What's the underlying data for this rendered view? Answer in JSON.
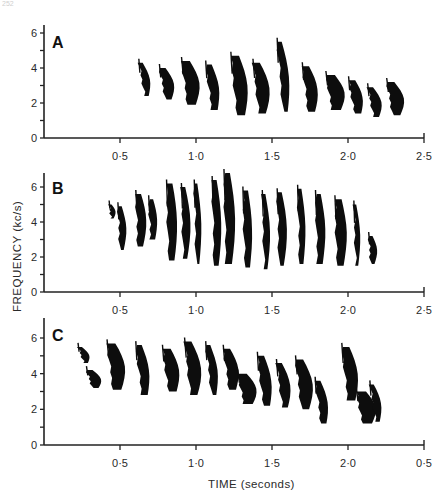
{
  "page_number": "252",
  "chart_data": [
    {
      "type": "spectrogram",
      "panel": "A",
      "title": "A",
      "xlabel": "TIME (seconds)",
      "ylabel": "FREQUENCY (kc/s)",
      "xlim": [
        0,
        2.5
      ],
      "ylim": [
        0,
        6.5
      ],
      "x_tick_labels": [
        "0·5",
        "1·0",
        "1·5",
        "2·0",
        "2·5"
      ],
      "y_tick_labels": [
        "0",
        "2",
        "4",
        "6"
      ],
      "y_minor_ticks": [
        1,
        3,
        5
      ],
      "grid": false,
      "description": "About 14 descending notes, approx 0.62–2.33 s, frequency band roughly 1.2–5.5 kc/s, drifting downward over time",
      "syllables": [
        {
          "t": 0.64,
          "f_top": 4.3,
          "f_bottom": 2.4
        },
        {
          "t": 0.78,
          "f_top": 4.0,
          "f_bottom": 2.2
        },
        {
          "t": 0.93,
          "f_top": 4.4,
          "f_bottom": 1.9
        },
        {
          "t": 1.08,
          "f_top": 4.2,
          "f_bottom": 1.6
        },
        {
          "t": 1.25,
          "f_top": 4.7,
          "f_bottom": 1.3
        },
        {
          "t": 1.4,
          "f_top": 4.3,
          "f_bottom": 1.4
        },
        {
          "t": 1.55,
          "f_top": 5.5,
          "f_bottom": 1.5
        },
        {
          "t": 1.72,
          "f_top": 4.1,
          "f_bottom": 1.5
        },
        {
          "t": 1.88,
          "f_top": 3.6,
          "f_bottom": 1.6
        },
        {
          "t": 2.02,
          "f_top": 3.3,
          "f_bottom": 1.4
        },
        {
          "t": 2.15,
          "f_top": 2.9,
          "f_bottom": 1.2
        },
        {
          "t": 2.28,
          "f_top": 3.2,
          "f_bottom": 1.3
        }
      ]
    },
    {
      "type": "spectrogram",
      "panel": "B",
      "title": "B",
      "xlabel": "TIME (seconds)",
      "ylabel": "FREQUENCY (kc/s)",
      "xlim": [
        0,
        2.5
      ],
      "ylim": [
        0,
        6.5
      ],
      "x_tick_labels": [
        "0·5",
        "1·0",
        "1·5",
        "2·0",
        "2·5"
      ],
      "y_tick_labels": [
        "0",
        "2",
        "4",
        "6"
      ],
      "y_minor_ticks": [
        1,
        3,
        5
      ],
      "grid": false,
      "description": "Faint thin strokes 0.42–0.75 s near 4–5 kc/s, then dense vertical notes 0.8–2.18 s spanning roughly 1.3–6.8 kc/s",
      "syllables": [
        {
          "t": 0.44,
          "f_top": 5.0,
          "f_bottom": 4.2
        },
        {
          "t": 0.5,
          "f_top": 4.9,
          "f_bottom": 2.4
        },
        {
          "t": 0.62,
          "f_top": 5.6,
          "f_bottom": 2.6
        },
        {
          "t": 0.7,
          "f_top": 5.3,
          "f_bottom": 3.0
        },
        {
          "t": 0.82,
          "f_top": 6.2,
          "f_bottom": 1.8
        },
        {
          "t": 0.92,
          "f_top": 6.0,
          "f_bottom": 1.9
        },
        {
          "t": 1.0,
          "f_top": 6.2,
          "f_bottom": 1.6
        },
        {
          "t": 1.12,
          "f_top": 6.4,
          "f_bottom": 1.5
        },
        {
          "t": 1.2,
          "f_top": 6.8,
          "f_bottom": 1.6
        },
        {
          "t": 1.32,
          "f_top": 5.8,
          "f_bottom": 1.4
        },
        {
          "t": 1.45,
          "f_top": 5.6,
          "f_bottom": 1.3
        },
        {
          "t": 1.55,
          "f_top": 5.7,
          "f_bottom": 1.5
        },
        {
          "t": 1.68,
          "f_top": 5.9,
          "f_bottom": 1.6
        },
        {
          "t": 1.8,
          "f_top": 5.6,
          "f_bottom": 1.6
        },
        {
          "t": 1.93,
          "f_top": 5.3,
          "f_bottom": 1.5
        },
        {
          "t": 2.05,
          "f_top": 5.0,
          "f_bottom": 1.5
        },
        {
          "t": 2.15,
          "f_top": 3.2,
          "f_bottom": 1.6
        }
      ]
    },
    {
      "type": "spectrogram",
      "panel": "C",
      "title": "C",
      "xlabel": "TIME (seconds)",
      "ylabel": "FREQUENCY (kc/s)",
      "xlim": [
        0,
        2.5
      ],
      "ylim": [
        0,
        6.5
      ],
      "x_tick_labels": [
        "0·5",
        "1·0",
        "1·5",
        "2·0",
        "0·5"
      ],
      "y_tick_labels": [
        "0",
        "2",
        "4",
        "6"
      ],
      "y_minor_ticks": [
        1,
        3,
        5
      ],
      "grid": false,
      "description": "Descending notes 0.22–0.95 s from ~5.5 to ~3 kc/s, a dense cluster 0.8–1.2 s, then scattered notes 1.2–2.2 s dipping to ~1 kc/s; last x tick labelled '0·5' as in original",
      "syllables": [
        {
          "t": 0.24,
          "f_top": 5.5,
          "f_bottom": 4.6
        },
        {
          "t": 0.3,
          "f_top": 4.2,
          "f_bottom": 3.2
        },
        {
          "t": 0.44,
          "f_top": 5.7,
          "f_bottom": 3.1
        },
        {
          "t": 0.62,
          "f_top": 5.6,
          "f_bottom": 2.8
        },
        {
          "t": 0.8,
          "f_top": 5.4,
          "f_bottom": 3.0
        },
        {
          "t": 0.95,
          "f_top": 5.8,
          "f_bottom": 2.8
        },
        {
          "t": 1.08,
          "f_top": 5.6,
          "f_bottom": 2.8
        },
        {
          "t": 1.2,
          "f_top": 5.4,
          "f_bottom": 3.1
        },
        {
          "t": 1.3,
          "f_top": 4.0,
          "f_bottom": 2.3
        },
        {
          "t": 1.42,
          "f_top": 5.0,
          "f_bottom": 2.2
        },
        {
          "t": 1.55,
          "f_top": 4.6,
          "f_bottom": 2.1
        },
        {
          "t": 1.68,
          "f_top": 4.8,
          "f_bottom": 2.0
        },
        {
          "t": 1.8,
          "f_top": 3.6,
          "f_bottom": 1.2
        },
        {
          "t": 1.98,
          "f_top": 5.5,
          "f_bottom": 2.5
        },
        {
          "t": 2.08,
          "f_top": 3.0,
          "f_bottom": 1.2
        },
        {
          "t": 2.16,
          "f_top": 3.4,
          "f_bottom": 1.3
        }
      ]
    }
  ],
  "axes": {
    "ylabel": "FREQUENCY (kc/s)",
    "xlabel": "TIME (seconds)"
  }
}
